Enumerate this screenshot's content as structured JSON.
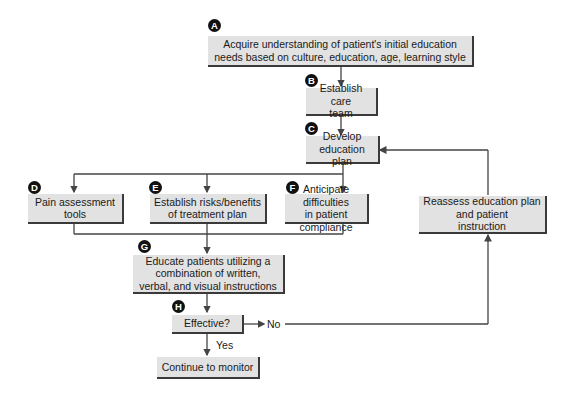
{
  "diagram": {
    "type": "flowchart",
    "colors": {
      "box_fill": "#e2e2e2",
      "box_shadow": "#3a3a3a",
      "line": "#444444",
      "badge": "#111111"
    },
    "nodes": [
      {
        "id": "A",
        "badge": "A",
        "text": "Acquire understanding of patient's initial education\nneeds based on culture, education, age, learning style"
      },
      {
        "id": "B",
        "badge": "B",
        "text": "Establish care\nteam"
      },
      {
        "id": "C",
        "badge": "C",
        "text": "Develop\neducation plan"
      },
      {
        "id": "D",
        "badge": "D",
        "text": "Pain assessment\ntools"
      },
      {
        "id": "E",
        "badge": "E",
        "text": "Establish risks/benefits\nof treatment plan"
      },
      {
        "id": "F",
        "badge": "F",
        "text": "Anticipate difficulties\nin patient compliance"
      },
      {
        "id": "R",
        "badge": "",
        "text": "Reassess education plan\nand patient\ninstruction"
      },
      {
        "id": "G",
        "badge": "G",
        "text": "Educate patients utilizing a\ncombination of written,\nverbal, and visual instructions"
      },
      {
        "id": "H",
        "badge": "H",
        "text": "Effective?"
      },
      {
        "id": "M",
        "badge": "",
        "text": "Continue to monitor"
      }
    ],
    "edge_labels": {
      "no": "No",
      "yes": "Yes"
    },
    "edges": [
      {
        "from": "A",
        "to": "B"
      },
      {
        "from": "B",
        "to": "C"
      },
      {
        "from": "C",
        "to": "D"
      },
      {
        "from": "C",
        "to": "E"
      },
      {
        "from": "C",
        "to": "F"
      },
      {
        "from": "D",
        "to": "G"
      },
      {
        "from": "E",
        "to": "G"
      },
      {
        "from": "F",
        "to": "G"
      },
      {
        "from": "G",
        "to": "H"
      },
      {
        "from": "H",
        "to": "R",
        "label": "No"
      },
      {
        "from": "H",
        "to": "M",
        "label": "Yes"
      },
      {
        "from": "R",
        "to": "C"
      }
    ]
  }
}
